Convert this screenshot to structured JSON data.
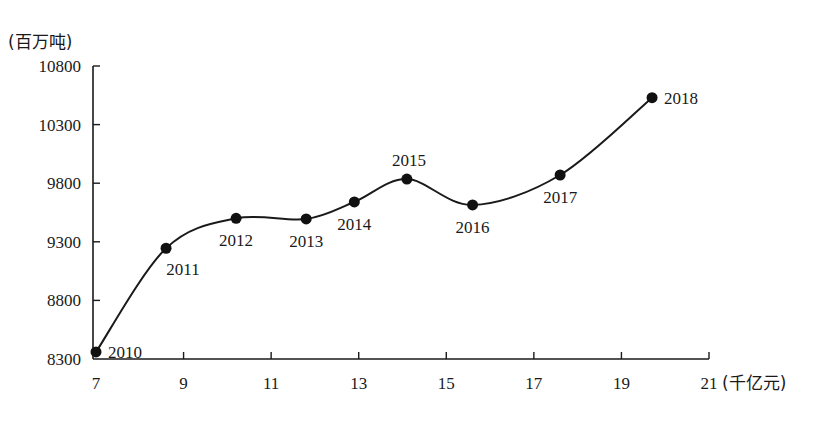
{
  "chart_data": {
    "type": "line",
    "title": "",
    "xlabel": "(千亿元)",
    "ylabel": "(百万吨)",
    "xlim": [
      7,
      21
    ],
    "ylim": [
      8300,
      10800
    ],
    "x_ticks": [
      "7",
      "9",
      "11",
      "13",
      "15",
      "17",
      "19",
      "21"
    ],
    "y_ticks": [
      "8300",
      "8800",
      "9300",
      "9800",
      "10300",
      "10800"
    ],
    "grid": false,
    "legend": null,
    "smooth": true,
    "points": [
      {
        "label": "2010",
        "x": 7.0,
        "y": 8360,
        "label_pos": "right"
      },
      {
        "label": "2011",
        "x": 8.6,
        "y": 9245,
        "label_pos": "below-right"
      },
      {
        "label": "2012",
        "x": 10.2,
        "y": 9500,
        "label_pos": "below"
      },
      {
        "label": "2013",
        "x": 11.8,
        "y": 9495,
        "label_pos": "below"
      },
      {
        "label": "2014",
        "x": 12.9,
        "y": 9640,
        "label_pos": "below"
      },
      {
        "label": "2015",
        "x": 14.1,
        "y": 9835,
        "label_pos": "above"
      },
      {
        "label": "2016",
        "x": 15.6,
        "y": 9615,
        "label_pos": "below"
      },
      {
        "label": "2017",
        "x": 17.6,
        "y": 9870,
        "label_pos": "below"
      },
      {
        "label": "2018",
        "x": 19.7,
        "y": 10530,
        "label_pos": "right"
      }
    ]
  }
}
